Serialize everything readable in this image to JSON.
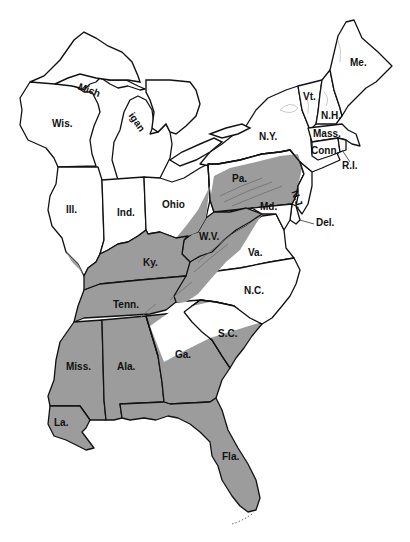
{
  "map": {
    "title": "",
    "region": "Eastern United States",
    "shade_color": "#9c9c9c",
    "background_color": "#ffffff",
    "border_color": "#111111",
    "legend": [
      {
        "label": "Shaded range",
        "color": "#9c9c9c"
      },
      {
        "label": "Unshaded",
        "color": "#ffffff"
      }
    ],
    "labels": {
      "me": "Me.",
      "vt": "Vt.",
      "nh": "N.H.",
      "mass": "Mass.",
      "conn": "Conn.",
      "ri": "R.I.",
      "ny": "N.Y.",
      "pa": "Pa.",
      "nj": "N.J.",
      "md": "Md.",
      "del": "Del.",
      "va": "Va.",
      "wv": "W.V.",
      "nc": "N.C.",
      "sc": "S.C.",
      "ga": "Ga.",
      "fla": "Fla.",
      "ala": "Ala.",
      "miss": "Miss.",
      "la": "La.",
      "tenn": "Tenn.",
      "ky": "Ky.",
      "ohio": "Ohio",
      "ind": "Ind.",
      "ill": "Ill.",
      "wis": "Wis.",
      "mich1": "Mich",
      "mich2": "igan"
    },
    "shaded_states": [
      "Ky.",
      "Tenn.",
      "Miss.",
      "Ala.",
      "Ga.",
      "Fla.",
      "La.",
      "S.C.",
      "W.V."
    ],
    "partially_shaded_states": [
      "Pa.",
      "Va.",
      "N.C.",
      "Ohio",
      "Md.",
      "Ill.",
      "N.Y."
    ]
  }
}
